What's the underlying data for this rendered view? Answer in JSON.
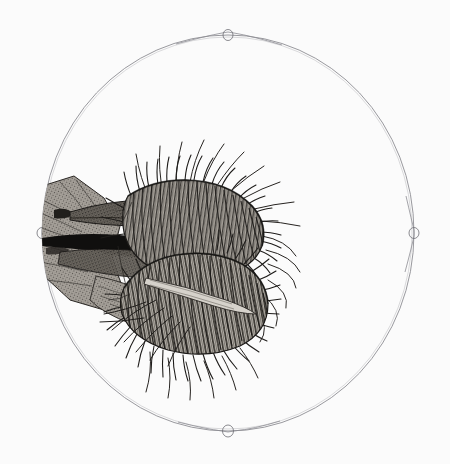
{
  "plate": {
    "background_color": "#fbfbfb",
    "ink_color": "#2b2b2b",
    "line_color": "#8d8d93",
    "width": 450,
    "height": 464,
    "medium": "pen-and-ink engraving",
    "caption": "",
    "title": ""
  },
  "field_of_view": {
    "name": "circular microscope field",
    "center_x": 228,
    "center_y": 233,
    "radius_x": 186,
    "radius_y": 198,
    "stroke_color": "#8d8d93",
    "stroke_width": 0.9,
    "nodes": [
      {
        "label": "top-node",
        "x": 228,
        "y": 35
      },
      {
        "label": "right-node",
        "x": 414,
        "y": 233
      },
      {
        "label": "bottom-node",
        "x": 228,
        "y": 431
      },
      {
        "label": "left-node",
        "x": 42,
        "y": 233
      }
    ]
  },
  "specimen": {
    "name": "hinged ciliated trap",
    "common_name": "Venus flytrap lobe",
    "orientation": "lateral, apex to the right",
    "bounds": {
      "x": 25,
      "y": 170,
      "width": 265,
      "height": 195
    },
    "parts": [
      {
        "label": "petiole",
        "description": "broad stippled stalk at left edge of field"
      },
      {
        "label": "upper-lobe",
        "description": "ciliated lobe, upper half of trap"
      },
      {
        "label": "lower-lobe",
        "description": "ciliated lobe, lower half of trap"
      },
      {
        "label": "midrib-hinge",
        "description": "dark hinge line between the two lobes"
      },
      {
        "label": "marginal-cilia",
        "description": "dense radiating setae along lobe margins"
      },
      {
        "label": "trailing-setae",
        "description": "long curved hairs extending right and down"
      }
    ]
  }
}
